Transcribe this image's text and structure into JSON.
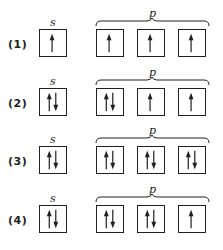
{
  "diagram": {
    "type": "orbital-box-diagram",
    "sublevel_labels": {
      "s": "s",
      "p": "p"
    },
    "colors": {
      "line": "#231f20",
      "background": "#ffffff"
    },
    "rows": [
      {
        "label": "(1)",
        "s": [
          "up"
        ],
        "p": [
          [
            "up"
          ],
          [
            "up"
          ],
          [
            "up"
          ]
        ]
      },
      {
        "label": "(2)",
        "s": [
          "up",
          "down"
        ],
        "p": [
          [
            "up",
            "down"
          ],
          [
            "up"
          ],
          [
            "up"
          ]
        ]
      },
      {
        "label": "(3)",
        "s": [
          "up",
          "down"
        ],
        "p": [
          [
            "up",
            "down"
          ],
          [
            "up",
            "down"
          ],
          [
            "up",
            "down"
          ]
        ]
      },
      {
        "label": "(4)",
        "s": [
          "up",
          "down"
        ],
        "p": [
          [
            "up",
            "down"
          ],
          [
            "up",
            "down"
          ],
          [
            "up"
          ]
        ]
      }
    ]
  }
}
